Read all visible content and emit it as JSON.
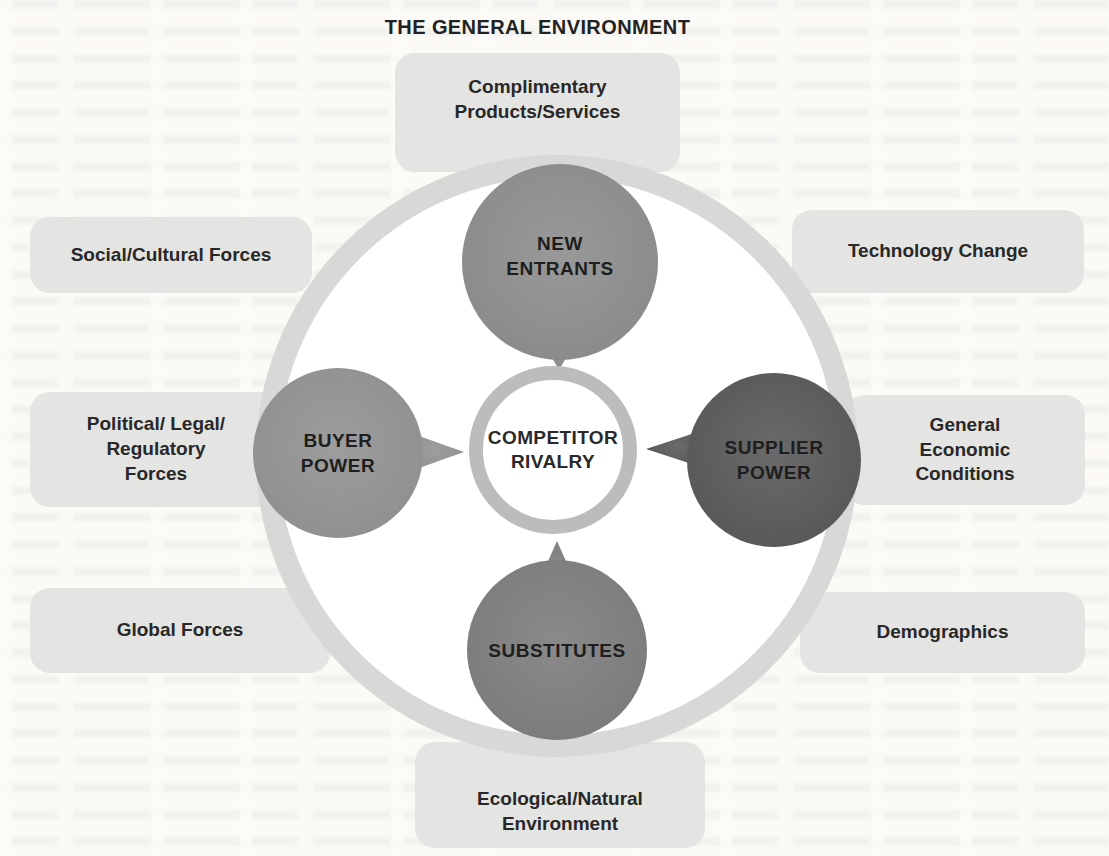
{
  "title": "THE GENERAL ENVIRONMENT",
  "environment_factors": {
    "complimentary": {
      "lines": [
        "Complimentary",
        "Products/Services"
      ]
    },
    "social": {
      "label": "Social/Cultural Forces"
    },
    "political": {
      "lines": [
        "Political/ Legal/",
        "Regulatory",
        "Forces"
      ]
    },
    "global": {
      "label": "Global Forces"
    },
    "technology": {
      "label": "Technology Change"
    },
    "economic": {
      "lines": [
        "General",
        "Economic",
        "Conditions"
      ]
    },
    "demographics": {
      "label": "Demographics"
    },
    "ecological": {
      "lines": [
        "Ecological/Natural",
        "Environment"
      ]
    }
  },
  "forces": {
    "center": {
      "lines": [
        "COMPETITOR",
        "RIVALRY"
      ]
    },
    "new_entrants": {
      "lines": [
        "NEW",
        "ENTRANTS"
      ]
    },
    "buyer_power": {
      "lines": [
        "BUYER",
        "POWER"
      ]
    },
    "supplier_power": {
      "lines": [
        "SUPPLIER",
        "POWER"
      ]
    },
    "substitutes": {
      "label": "SUBSTITUTES"
    }
  },
  "colors": {
    "page_bg": "#fbfaf7",
    "factor_box_bg": "#e4e4e2",
    "outer_ring": "#d8d8d6",
    "center_ring": "#bcbcbc",
    "new_entrants_fill": "#8f8f8f",
    "buyer_power_fill": "#949494",
    "supplier_power_fill": "#5e5e5e",
    "substitutes_fill": "#818181",
    "label_text": "#282828"
  }
}
